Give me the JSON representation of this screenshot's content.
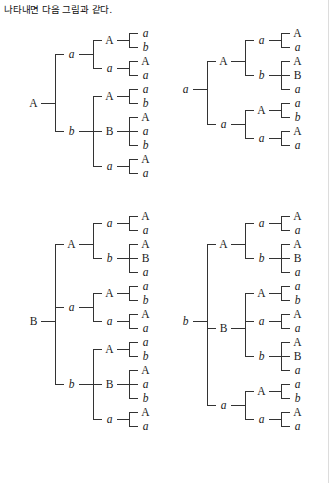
{
  "caption": "나타내면 다음 그림과 같다.",
  "colors": {
    "ink": "#1a1a1a",
    "rule": "#333333",
    "page": "#ffffff",
    "scan_edge": "#dcdcdc"
  },
  "figure": {
    "trees": [
      {
        "name": "tree-top-left",
        "x": 26,
        "y": 26,
        "leaf_count": 12,
        "root": {
          "label": "A",
          "style": "roman",
          "children": [
            {
              "label": "a",
              "style": "italic",
              "children": [
                {
                  "label": "A",
                  "style": "roman",
                  "children": [
                    {
                      "label": "a",
                      "style": "italic"
                    },
                    {
                      "label": "b",
                      "style": "italic"
                    }
                  ]
                },
                {
                  "label": "a",
                  "style": "italic",
                  "children": [
                    {
                      "label": "A",
                      "style": "roman"
                    },
                    {
                      "label": "a",
                      "style": "italic"
                    }
                  ]
                }
              ]
            },
            {
              "label": "b",
              "style": "italic",
              "children": [
                {
                  "label": "A",
                  "style": "roman",
                  "children": [
                    {
                      "label": "a",
                      "style": "italic"
                    },
                    {
                      "label": "b",
                      "style": "italic"
                    }
                  ]
                },
                {
                  "label": "B",
                  "style": "roman",
                  "children": [
                    {
                      "label": "A",
                      "style": "roman"
                    },
                    {
                      "label": "a",
                      "style": "italic"
                    },
                    {
                      "label": "b",
                      "style": "italic"
                    }
                  ]
                },
                {
                  "label": "a",
                  "style": "italic",
                  "children": [
                    {
                      "label": "A",
                      "style": "roman"
                    },
                    {
                      "label": "a",
                      "style": "italic"
                    }
                  ]
                }
              ]
            }
          ]
        }
      },
      {
        "name": "tree-top-right",
        "x": 178,
        "y": 26,
        "leaf_count": 8,
        "root": {
          "label": "a",
          "style": "italic",
          "children": [
            {
              "label": "A",
              "style": "roman",
              "children": [
                {
                  "label": "a",
                  "style": "italic",
                  "children": [
                    {
                      "label": "A",
                      "style": "roman"
                    },
                    {
                      "label": "a",
                      "style": "italic"
                    }
                  ]
                },
                {
                  "label": "b",
                  "style": "italic",
                  "children": [
                    {
                      "label": "A",
                      "style": "roman"
                    },
                    {
                      "label": "B",
                      "style": "roman"
                    },
                    {
                      "label": "a",
                      "style": "italic"
                    }
                  ]
                }
              ]
            },
            {
              "label": "a",
              "style": "italic",
              "children": [
                {
                  "label": "A",
                  "style": "roman",
                  "children": [
                    {
                      "label": "a",
                      "style": "italic"
                    },
                    {
                      "label": "b",
                      "style": "italic"
                    }
                  ]
                },
                {
                  "label": "a",
                  "style": "italic",
                  "children": [
                    {
                      "label": "A",
                      "style": "roman"
                    },
                    {
                      "label": "a",
                      "style": "italic"
                    }
                  ]
                }
              ]
            }
          ]
        }
      },
      {
        "name": "tree-bottom-left",
        "x": 26,
        "y": 209,
        "leaf_count": 17,
        "root": {
          "label": "B",
          "style": "roman",
          "children": [
            {
              "label": "A",
              "style": "roman",
              "children": [
                {
                  "label": "a",
                  "style": "italic",
                  "children": [
                    {
                      "label": "A",
                      "style": "roman"
                    },
                    {
                      "label": "a",
                      "style": "italic"
                    }
                  ]
                },
                {
                  "label": "b",
                  "style": "italic",
                  "children": [
                    {
                      "label": "A",
                      "style": "roman"
                    },
                    {
                      "label": "B",
                      "style": "roman"
                    },
                    {
                      "label": "a",
                      "style": "italic"
                    }
                  ]
                }
              ]
            },
            {
              "label": "a",
              "style": "italic",
              "children": [
                {
                  "label": "A",
                  "style": "roman",
                  "children": [
                    {
                      "label": "a",
                      "style": "italic"
                    },
                    {
                      "label": "b",
                      "style": "italic"
                    }
                  ]
                },
                {
                  "label": "a",
                  "style": "italic",
                  "children": [
                    {
                      "label": "A",
                      "style": "roman"
                    },
                    {
                      "label": "a",
                      "style": "italic"
                    }
                  ]
                }
              ]
            },
            {
              "label": "b",
              "style": "italic",
              "children": [
                {
                  "label": "A",
                  "style": "roman",
                  "children": [
                    {
                      "label": "a",
                      "style": "italic"
                    },
                    {
                      "label": "b",
                      "style": "italic"
                    }
                  ]
                },
                {
                  "label": "B",
                  "style": "roman",
                  "children": [
                    {
                      "label": "A",
                      "style": "roman"
                    },
                    {
                      "label": "a",
                      "style": "italic"
                    },
                    {
                      "label": "b",
                      "style": "italic"
                    }
                  ]
                },
                {
                  "label": "a",
                  "style": "italic",
                  "children": [
                    {
                      "label": "A",
                      "style": "roman"
                    },
                    {
                      "label": "a",
                      "style": "italic"
                    }
                  ]
                }
              ]
            }
          ]
        }
      },
      {
        "name": "tree-bottom-right",
        "x": 178,
        "y": 209,
        "leaf_count": 17,
        "root": {
          "label": "b",
          "style": "italic",
          "children": [
            {
              "label": "A",
              "style": "roman",
              "children": [
                {
                  "label": "a",
                  "style": "italic",
                  "children": [
                    {
                      "label": "A",
                      "style": "roman"
                    },
                    {
                      "label": "a",
                      "style": "italic"
                    }
                  ]
                },
                {
                  "label": "b",
                  "style": "italic",
                  "children": [
                    {
                      "label": "A",
                      "style": "roman"
                    },
                    {
                      "label": "B",
                      "style": "roman"
                    },
                    {
                      "label": "a",
                      "style": "italic"
                    }
                  ]
                }
              ]
            },
            {
              "label": "B",
              "style": "roman",
              "children": [
                {
                  "label": "A",
                  "style": "roman",
                  "children": [
                    {
                      "label": "a",
                      "style": "italic"
                    },
                    {
                      "label": "b",
                      "style": "italic"
                    }
                  ]
                },
                {
                  "label": "a",
                  "style": "italic",
                  "children": [
                    {
                      "label": "A",
                      "style": "roman"
                    },
                    {
                      "label": "a",
                      "style": "italic"
                    }
                  ]
                },
                {
                  "label": "b",
                  "style": "italic",
                  "children": [
                    {
                      "label": "A",
                      "style": "roman"
                    },
                    {
                      "label": "B",
                      "style": "roman"
                    },
                    {
                      "label": "a",
                      "style": "italic"
                    }
                  ]
                }
              ]
            },
            {
              "label": "a",
              "style": "italic",
              "children": [
                {
                  "label": "A",
                  "style": "roman",
                  "children": [
                    {
                      "label": "a",
                      "style": "italic"
                    },
                    {
                      "label": "b",
                      "style": "italic"
                    }
                  ]
                },
                {
                  "label": "a",
                  "style": "italic",
                  "children": [
                    {
                      "label": "A",
                      "style": "roman"
                    },
                    {
                      "label": "a",
                      "style": "italic"
                    }
                  ]
                }
              ]
            }
          ]
        }
      }
    ]
  },
  "layout": {
    "row_height": 14,
    "lead_widths": [
      14,
      14,
      12
    ],
    "label_widths": [
      13,
      13,
      13,
      13
    ]
  }
}
